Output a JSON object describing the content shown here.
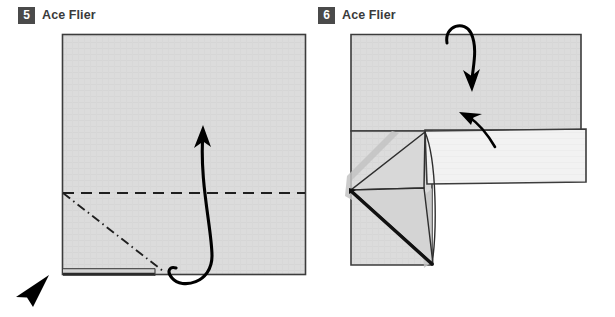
{
  "page": {
    "background_color": "#ffffff",
    "type": "origami-instruction-diagram",
    "model_name": "Ace Flier"
  },
  "steps": [
    {
      "number": "5",
      "title": "Ace Flier",
      "badge_color": "#4a4a4a",
      "badge_text_color": "#ffffff",
      "diagram": {
        "shape": "square-sheet",
        "paper_fill": "#dcdcdc",
        "outline_color": "#3c3c3c",
        "fold_lines": [
          {
            "kind": "valley-fold-dashed",
            "orientation": "horizontal"
          },
          {
            "kind": "mountain-fold-dash-dot",
            "orientation": "diagonal"
          }
        ],
        "arrows": [
          {
            "kind": "fold-up-loop-arrow",
            "direction": "up"
          }
        ],
        "cursor": {
          "kind": "pointer-arrowhead",
          "color": "#000000"
        }
      }
    },
    {
      "number": "6",
      "title": "Ace Flier",
      "badge_color": "#4a4a4a",
      "badge_text_color": "#ffffff",
      "diagram": {
        "shape": "l-shaped-folded-sheet",
        "paper_fill": "#dcdcdc",
        "flap_fill": "#f2f2f2",
        "shadow_fill": "#c0c0c0",
        "outline_color": "#3c3c3c",
        "arrows": [
          {
            "kind": "fold-over-top-arrow",
            "direction": "down"
          },
          {
            "kind": "small-fold-arrow",
            "direction": "up-left"
          }
        ]
      }
    }
  ]
}
